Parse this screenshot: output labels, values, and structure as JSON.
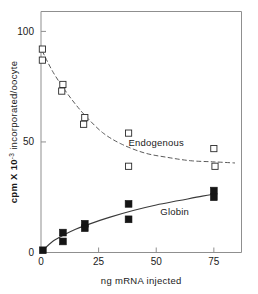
{
  "chart_data": {
    "type": "scatter",
    "title": "",
    "subtitle": "",
    "xlabel": "ng mRNA injected",
    "ylabel": "cpm X 10⁻³ incorporated/oocyte",
    "ylabel_parts": {
      "prefix": "cpm X 10",
      "exponent": "-3",
      "suffix": " incorporated/oocyte"
    },
    "xlim": [
      0,
      87
    ],
    "ylim": [
      0,
      109
    ],
    "xticks": [
      0,
      25,
      50,
      75
    ],
    "xtick_labels": [
      "0",
      "25",
      "50",
      "75"
    ],
    "yticks": [
      0,
      50,
      100
    ],
    "ytick_labels": [
      "0",
      "50",
      "100"
    ],
    "grid": false,
    "legend_position": "inline-annotation",
    "frame": "box",
    "series": [
      {
        "name": "Endogenous",
        "marker": "open-square",
        "marker_color": "#ffffff",
        "marker_edge_color": "#2a2a2a",
        "line_style": "dashed",
        "line_color": "#5a5a5a",
        "annotation": "Endogenous",
        "annotation_x": 50,
        "annotation_y": 48,
        "points": [
          {
            "x": 0.6,
            "y": 92
          },
          {
            "x": 0.6,
            "y": 87
          },
          {
            "x": 9.5,
            "y": 76
          },
          {
            "x": 9.0,
            "y": 73
          },
          {
            "x": 19.0,
            "y": 61
          },
          {
            "x": 18.5,
            "y": 58
          },
          {
            "x": 38.0,
            "y": 54
          },
          {
            "x": 38.0,
            "y": 39
          },
          {
            "x": 75.0,
            "y": 47
          },
          {
            "x": 75.5,
            "y": 39
          }
        ],
        "curve": [
          {
            "x": 0.6,
            "y": 91
          },
          {
            "x": 5,
            "y": 82
          },
          {
            "x": 10,
            "y": 74
          },
          {
            "x": 15,
            "y": 67
          },
          {
            "x": 20,
            "y": 61
          },
          {
            "x": 27,
            "y": 54
          },
          {
            "x": 35,
            "y": 49
          },
          {
            "x": 45,
            "y": 45
          },
          {
            "x": 55,
            "y": 43
          },
          {
            "x": 65,
            "y": 41.5
          },
          {
            "x": 75,
            "y": 41
          },
          {
            "x": 84,
            "y": 40.5
          }
        ]
      },
      {
        "name": "Globin",
        "marker": "filled-square",
        "marker_color": "#151515",
        "marker_edge_color": "#151515",
        "line_style": "solid",
        "line_color": "#3a3a3a",
        "annotation": "Globin",
        "annotation_x": 58,
        "annotation_y": 17,
        "points": [
          {
            "x": 0.8,
            "y": 1
          },
          {
            "x": 9.5,
            "y": 9
          },
          {
            "x": 9.5,
            "y": 5
          },
          {
            "x": 19.0,
            "y": 13
          },
          {
            "x": 19.0,
            "y": 11
          },
          {
            "x": 38.0,
            "y": 22
          },
          {
            "x": 38.0,
            "y": 15
          },
          {
            "x": 75.0,
            "y": 28
          },
          {
            "x": 75.0,
            "y": 25
          }
        ],
        "curve": [
          {
            "x": 0.8,
            "y": 1
          },
          {
            "x": 5,
            "y": 5
          },
          {
            "x": 10,
            "y": 8
          },
          {
            "x": 15,
            "y": 10.5
          },
          {
            "x": 20,
            "y": 12.5
          },
          {
            "x": 30,
            "y": 16
          },
          {
            "x": 40,
            "y": 19
          },
          {
            "x": 50,
            "y": 21.5
          },
          {
            "x": 60,
            "y": 23.5
          },
          {
            "x": 70,
            "y": 25.5
          },
          {
            "x": 76,
            "y": 26.5
          }
        ]
      }
    ]
  }
}
